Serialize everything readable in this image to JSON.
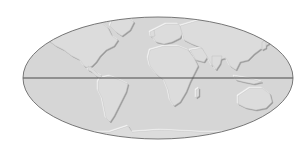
{
  "map": {
    "projection": "mollweide-like ellipse",
    "style": "embossed relief, grayscale",
    "colors": {
      "background": "#ffffff",
      "ocean": "#d6d6d6",
      "land": "#dedede",
      "land_highlight": "#f2f2f2",
      "land_shadow": "#a8a8a8",
      "outline": "#6a6a6a",
      "equator": "#4a4a4a"
    },
    "features": {
      "equator_line": true,
      "continents": [
        "North America",
        "South America",
        "Europe",
        "Africa",
        "Asia",
        "Australia",
        "Antarctica",
        "Greenland"
      ]
    }
  }
}
